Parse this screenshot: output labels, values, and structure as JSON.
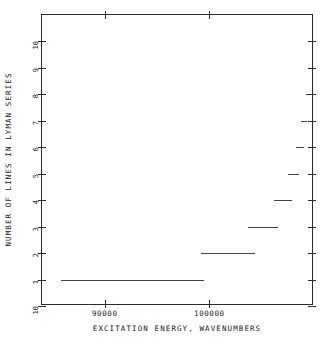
{
  "chart_data": {
    "type": "line",
    "title": "",
    "xlabel": "EXCITATION ENERGY, WAVENUMBERS",
    "ylabel": "NUMBER OF LINES IN LYMAN SERIES",
    "xlim": [
      84000,
      110000
    ],
    "ylim": [
      0,
      11
    ],
    "grid": false,
    "legend": null,
    "x_ticks": [
      {
        "value": 90000,
        "label": "90000"
      },
      {
        "value": 100000,
        "label": "100000"
      }
    ],
    "y_ticks": [
      {
        "value": 10,
        "label": "10"
      },
      {
        "value": 9,
        "label": "9"
      },
      {
        "value": 8,
        "label": "8"
      },
      {
        "value": 7,
        "label": "7"
      },
      {
        "value": 6,
        "label": "6"
      },
      {
        "value": 5,
        "label": "5"
      },
      {
        "value": 4,
        "label": "4"
      },
      {
        "value": 3,
        "label": "3"
      },
      {
        "value": 2,
        "label": "2"
      },
      {
        "value": 1,
        "label": "1"
      },
      {
        "value": 0,
        "label": "10"
      }
    ],
    "series": [
      {
        "name": "lines in Lyman series",
        "style": "step-segments",
        "segments": [
          {
            "y": 1,
            "x_start": 85800,
            "x_end": 99500
          },
          {
            "y": 2,
            "x_start": 99200,
            "x_end": 104400
          },
          {
            "y": 3,
            "x_start": 103700,
            "x_end": 106600
          },
          {
            "y": 4,
            "x_start": 106200,
            "x_end": 107900
          },
          {
            "y": 5,
            "x_start": 107500,
            "x_end": 108600
          },
          {
            "y": 6,
            "x_start": 108300,
            "x_end": 109000
          },
          {
            "y": 7,
            "x_start": 108800,
            "x_end": 109300
          },
          {
            "y": 8,
            "x_start": 109200,
            "x_end": 109500
          },
          {
            "y": 9,
            "x_start": 109400,
            "x_end": 109650
          },
          {
            "y": 10,
            "x_start": 109600,
            "x_end": 110000
          }
        ]
      }
    ]
  }
}
